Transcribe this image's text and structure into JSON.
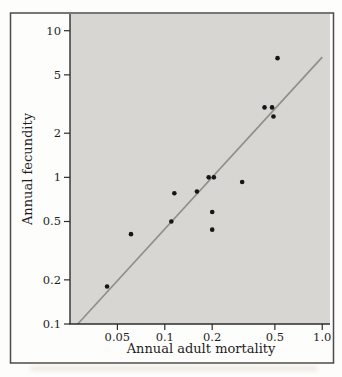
{
  "chart_data": {
    "type": "scatter",
    "title": "",
    "xlabel": "Annual adult mortality",
    "ylabel": "Annual fecundity",
    "x_scale": "log",
    "y_scale": "log",
    "xlim": [
      0.025,
      1.12
    ],
    "ylim": [
      0.1,
      13
    ],
    "grid": false,
    "legend": null,
    "x_ticks": {
      "values": [
        0.05,
        0.1,
        0.2,
        0.5,
        1.0
      ],
      "labels": [
        "0.05",
        "0.1",
        "0.2",
        "0.5",
        "1.0"
      ]
    },
    "y_ticks": {
      "values": [
        10,
        5,
        2,
        1,
        0.5,
        0.2,
        0.1
      ],
      "labels": [
        "10",
        "5",
        "2",
        "1",
        "0.5",
        "0.2",
        "0.1"
      ]
    },
    "points": [
      [
        0.043,
        0.18
      ],
      [
        0.061,
        0.41
      ],
      [
        0.11,
        0.5
      ],
      [
        0.115,
        0.78
      ],
      [
        0.16,
        0.8
      ],
      [
        0.19,
        1.0
      ],
      [
        0.205,
        1.0
      ],
      [
        0.2,
        0.58
      ],
      [
        0.2,
        0.44
      ],
      [
        0.31,
        0.93
      ],
      [
        0.43,
        3.0
      ],
      [
        0.48,
        3.0
      ],
      [
        0.49,
        2.6
      ],
      [
        0.52,
        6.5
      ]
    ],
    "trend_line": {
      "x1": 0.028,
      "y1": 0.1,
      "x2": 1.0,
      "y2": 6.6
    },
    "colors": {
      "panel_bg": "#d7d6d2",
      "trend_line": "#8f8f8c",
      "point": "#161616",
      "axis": "#2e2d2c",
      "text": "#1e1d1c",
      "frame": "#4c4b49"
    }
  }
}
